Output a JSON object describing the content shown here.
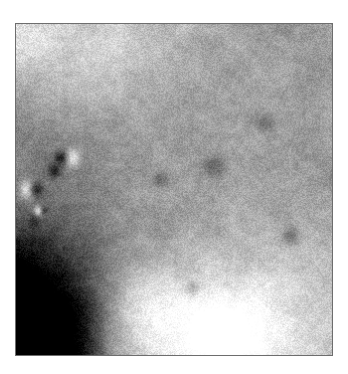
{
  "page": {
    "background_color": "#ffffff",
    "width": 348,
    "height": 374
  },
  "caption": {
    "text": "",
    "visible_fragment": "·",
    "color": "#c9c9c9",
    "note": "partially cropped faint text sliver at top edge"
  },
  "image_plate": {
    "label": "planetary-surface-photograph",
    "frame_color": "#6d6d6d",
    "frame_width_px": 1,
    "x": 15,
    "y": 23,
    "width": 318,
    "height": 333,
    "alt_text": "Grainy grayscale oblique view of a cratered planetary surface"
  },
  "chart_data": {
    "type": "heatmap",
    "title": "",
    "xlabel": "",
    "ylabel": "",
    "colormap": "grayscale",
    "value_range": [
      0.05,
      0.97
    ],
    "grid": false,
    "legend": null,
    "background_gradient_stops": [
      {
        "x": 0.0,
        "y": 0.0,
        "value": 0.78
      },
      {
        "x": 0.35,
        "y": 0.0,
        "value": 0.7
      },
      {
        "x": 1.0,
        "y": 0.0,
        "value": 0.6
      },
      {
        "x": 0.0,
        "y": 0.35,
        "value": 0.48
      },
      {
        "x": 0.5,
        "y": 0.45,
        "value": 0.62
      },
      {
        "x": 1.0,
        "y": 0.4,
        "value": 0.61
      },
      {
        "x": 0.0,
        "y": 0.78,
        "value": 0.1
      },
      {
        "x": 0.12,
        "y": 0.92,
        "value": 0.06
      },
      {
        "x": 0.45,
        "y": 0.88,
        "value": 0.8
      },
      {
        "x": 0.7,
        "y": 0.95,
        "value": 0.88
      },
      {
        "x": 1.0,
        "y": 0.8,
        "value": 0.74
      }
    ],
    "features": [
      {
        "name": "bright-crater-rim-left-edge",
        "cx": 0.035,
        "cy": 0.5,
        "r": 0.03,
        "value": 0.95,
        "shadow_dx": 0.03,
        "shadow_value": 0.12
      },
      {
        "name": "bright-boulder-upper-left",
        "cx": 0.175,
        "cy": 0.405,
        "r": 0.03,
        "value": 0.93,
        "shadow_dx": -0.035,
        "shadow_value": 0.1
      },
      {
        "name": "small-bright-knob-left",
        "cx": 0.07,
        "cy": 0.565,
        "r": 0.016,
        "value": 0.86,
        "shadow_dx": 0.02,
        "shadow_value": 0.22
      },
      {
        "name": "dark-pit-mid-left",
        "cx": 0.12,
        "cy": 0.445,
        "r": 0.022,
        "value": 0.12,
        "shadow_dx": 0.0,
        "shadow_value": 0.12
      },
      {
        "name": "dark-pit-left-low",
        "cx": 0.055,
        "cy": 0.6,
        "r": 0.02,
        "value": 0.16,
        "shadow_dx": 0.0,
        "shadow_value": 0.16
      },
      {
        "name": "faint-crater-mid",
        "cx": 0.47,
        "cy": 0.47,
        "r": 0.028,
        "value": 0.52,
        "shadow_dx": -0.018,
        "shadow_value": 0.42
      },
      {
        "name": "faint-crater-mid-right",
        "cx": 0.64,
        "cy": 0.43,
        "r": 0.034,
        "value": 0.5,
        "shadow_dx": -0.02,
        "shadow_value": 0.4
      },
      {
        "name": "faint-crater-upper-right",
        "cx": 0.8,
        "cy": 0.3,
        "r": 0.026,
        "value": 0.52,
        "shadow_dx": -0.016,
        "shadow_value": 0.43
      },
      {
        "name": "dark-smudge-right",
        "cx": 0.87,
        "cy": 0.64,
        "r": 0.03,
        "value": 0.45,
        "shadow_dx": 0.0,
        "shadow_value": 0.45
      },
      {
        "name": "dark-smudge-lower-center",
        "cx": 0.56,
        "cy": 0.8,
        "r": 0.022,
        "value": 0.52,
        "shadow_dx": 0.0,
        "shadow_value": 0.52
      },
      {
        "name": "bright-patch-lower-center",
        "cx": 0.62,
        "cy": 0.93,
        "r": 0.09,
        "value": 0.92,
        "shadow_dx": 0.0,
        "shadow_value": 0.92
      },
      {
        "name": "shadow-wedge-lower-left",
        "cx": 0.03,
        "cy": 0.9,
        "r": 0.13,
        "value": 0.05,
        "shadow_dx": 0.0,
        "shadow_value": 0.05
      }
    ],
    "noise": {
      "type": "fine-speckle",
      "amplitude": 0.085,
      "scale_px": 1.6
    }
  }
}
